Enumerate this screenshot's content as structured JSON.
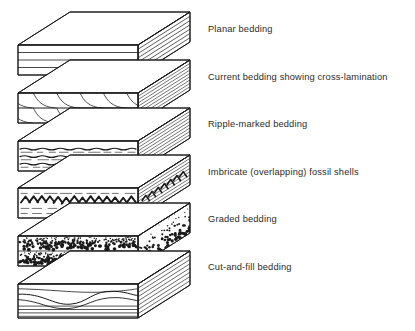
{
  "figure": {
    "background_color": "#ffffff",
    "ink_color": "#1a1a1a",
    "text_color": "#2b2b2b",
    "width": 415,
    "height": 331
  },
  "labels": [
    {
      "id": "planar",
      "text": "Planar bedding",
      "x": 208,
      "y": 24
    },
    {
      "id": "current",
      "text": "Current bedding showing cross-lamination",
      "x": 208,
      "y": 72
    },
    {
      "id": "ripple",
      "text": "Ripple-marked bedding",
      "x": 208,
      "y": 119
    },
    {
      "id": "imbricate",
      "text": "Imbricate (overlapping) fossil shells",
      "x": 208,
      "y": 167
    },
    {
      "id": "graded",
      "text": "Graded bedding",
      "x": 208,
      "y": 214
    },
    {
      "id": "cutfill",
      "text": "Cut-and-fill bedding",
      "x": 208,
      "y": 262
    }
  ],
  "blocks": [
    {
      "id": "block-planar",
      "name": "planar-bedding-block",
      "label_ref": "Planar bedding",
      "pattern": "horizontal-parallel-laminae",
      "front_top_y": 45,
      "front_height": 30,
      "left_x": 18,
      "front_width": 120,
      "depth_x": 52,
      "depth_y": -33,
      "lamina_count": 3,
      "side_line_count": 7
    },
    {
      "id": "block-current",
      "name": "current-cross-lamination-block",
      "label_ref": "Current bedding showing cross-lamination",
      "pattern": "curved-cross-laminae-sets",
      "front_top_y": 93,
      "front_height": 30,
      "left_x": 18,
      "front_width": 120,
      "depth_x": 52,
      "depth_y": -33,
      "set_count": 2,
      "foresets_per_set": 6
    },
    {
      "id": "block-ripple",
      "name": "ripple-marked-bedding-block",
      "label_ref": "Ripple-marked bedding",
      "pattern": "wavy-ripple-laminae",
      "front_top_y": 141,
      "front_height": 30,
      "left_x": 18,
      "front_width": 120,
      "depth_x": 52,
      "depth_y": -33,
      "ripple_rows": 3
    },
    {
      "id": "block-imbricate",
      "name": "imbricate-fossil-shells-block",
      "label_ref": "Imbricate (overlapping) fossil shells",
      "pattern": "imbricated-shell-band",
      "front_top_y": 188,
      "front_height": 30,
      "left_x": 18,
      "front_width": 120,
      "depth_x": 52,
      "depth_y": -33,
      "shell_count": 14
    },
    {
      "id": "block-graded",
      "name": "graded-bedding-block",
      "label_ref": "Graded bedding",
      "pattern": "fining-upward-stipple-cycles",
      "front_top_y": 236,
      "front_height": 30,
      "left_x": 18,
      "front_width": 120,
      "depth_x": 52,
      "depth_y": -33,
      "cycles": 2
    },
    {
      "id": "block-cutfill",
      "name": "cut-and-fill-bedding-block",
      "label_ref": "Cut-and-fill bedding",
      "pattern": "channel-scour-and-fill",
      "front_top_y": 284,
      "front_height": 34,
      "left_x": 18,
      "front_width": 120,
      "depth_x": 52,
      "depth_y": -33,
      "channel_count": 2
    }
  ]
}
